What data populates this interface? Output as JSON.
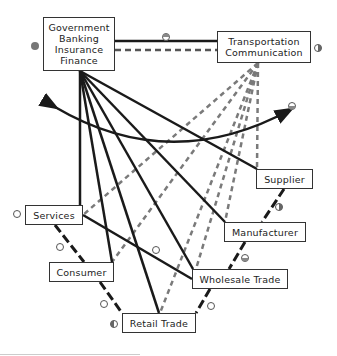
{
  "diagram": {
    "nodes": {
      "government": {
        "lines": [
          "Government",
          "Banking",
          "Insurance",
          "Finance"
        ]
      },
      "transportation": {
        "lines": [
          "Transportation",
          "Communication"
        ]
      },
      "supplier": {
        "label": "Supplier"
      },
      "manufacturer": {
        "label": "Manufacturer"
      },
      "wholesale": {
        "label": "Wholesale Trade"
      },
      "retail": {
        "label": "Retail Trade"
      },
      "consumer": {
        "label": "Consumer"
      },
      "services": {
        "label": "Services"
      }
    },
    "markers": [
      {
        "id": "government",
        "type": "filled-circle"
      },
      {
        "id": "gov-transport-link",
        "type": "half-top-circle"
      },
      {
        "id": "transportation",
        "type": "half-right-circle"
      },
      {
        "id": "curved-arrow-end",
        "type": "half-bottom-circle"
      },
      {
        "id": "supplier-manufacturer-link",
        "type": "half-right-circle"
      },
      {
        "id": "manufacturer-wholesale-link",
        "type": "half-bottom-circle"
      },
      {
        "id": "wholesale-retail-link",
        "type": "open-circle"
      },
      {
        "id": "services",
        "type": "open-circle"
      },
      {
        "id": "services-consumer-link",
        "type": "open-circle"
      },
      {
        "id": "consumer-retail-link",
        "type": "open-circle"
      },
      {
        "id": "retail",
        "type": "half-left-circle"
      },
      {
        "id": "services-wholesale-link",
        "type": "open-circle"
      }
    ],
    "legend_line_styles": {
      "solid_black": "financial/government flows",
      "gray_dashed": "transportation/communication flows",
      "black_dashed": "goods chain"
    },
    "colors": {
      "solid": "#1a1a1a",
      "gray_dashed": "#7a7a7a",
      "chain": "#1a1a1a",
      "marker_fill": "#888888"
    }
  }
}
